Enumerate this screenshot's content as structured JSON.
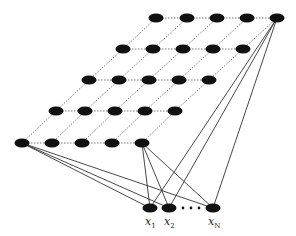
{
  "diagram": {
    "type": "self-organizing-map-lattice",
    "colors": {
      "node": "#111111",
      "grid_line": "#555555",
      "connection": "#333333",
      "background": "#ffffff"
    },
    "grid_rows": [
      {
        "y": 18,
        "x": [
          156,
          187,
          217,
          247,
          277
        ]
      },
      {
        "y": 49,
        "x": [
          123,
          153,
          183,
          213,
          243
        ]
      },
      {
        "y": 80,
        "x": [
          89,
          119,
          149,
          179,
          209
        ]
      },
      {
        "y": 111,
        "x": [
          56,
          85,
          115,
          145,
          175
        ]
      },
      {
        "y": 143,
        "x": [
          22,
          52,
          82,
          112,
          142
        ]
      }
    ],
    "inputs": [
      {
        "id": "x1",
        "x": 150,
        "y": 208,
        "label": "x",
        "sub": "1"
      },
      {
        "id": "x2",
        "x": 169,
        "y": 208,
        "label": "x",
        "sub": "2"
      },
      {
        "id": "xN",
        "x": 213,
        "y": 208,
        "label": "x",
        "sub": "N"
      }
    ],
    "ellipsis_dots": [
      183,
      191,
      199
    ],
    "connected_grid_nodes": [
      [
        0,
        4
      ],
      [
        4,
        0
      ],
      [
        4,
        4
      ]
    ]
  }
}
